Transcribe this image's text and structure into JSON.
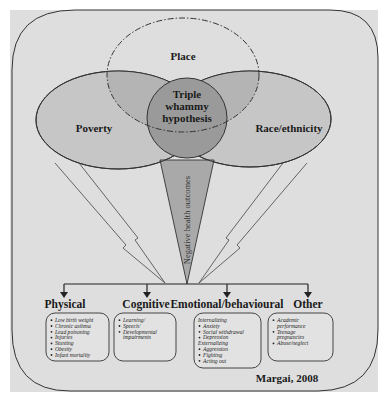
{
  "figure": {
    "colors": {
      "background": "#dedede",
      "frame_stroke": "#333333",
      "ellipse_fill": "#c4c4c4",
      "ellipse_stroke": "#333333",
      "center_fill": "#999999",
      "triangle_fill": "#aaaaaa",
      "arrow_stroke": "#444444"
    },
    "venn": {
      "place_label": "Place",
      "poverty_label": "Poverty",
      "race_label": "Race/ethnicity",
      "center_label": [
        "Triple",
        "whammy",
        "hypothesis"
      ]
    },
    "funnel_label": "Negative health outcomes",
    "categories": [
      {
        "label": "Physical",
        "items": [
          {
            "type": "bullet",
            "text": "Low birth weight"
          },
          {
            "type": "bullet",
            "text": "Chronic asthma"
          },
          {
            "type": "bullet",
            "text": "Lead poisoning"
          },
          {
            "type": "bullet",
            "text": "Injuries"
          },
          {
            "type": "bullet",
            "text": "Stunting"
          },
          {
            "type": "bullet",
            "text": "Obesity"
          },
          {
            "type": "bullet",
            "text": "Infant mortality"
          }
        ]
      },
      {
        "label": "Cognitive",
        "items": [
          {
            "type": "bullet",
            "text": "Learning/"
          },
          {
            "type": "bullet",
            "text": "Speech/"
          },
          {
            "type": "bullet",
            "text": "Developmental"
          },
          {
            "type": "cont",
            "text": "impairments"
          }
        ]
      },
      {
        "label": "Emotional/behavioural",
        "items": [
          {
            "type": "head",
            "text": "Internalizing"
          },
          {
            "type": "bullet",
            "text": "Anxiety"
          },
          {
            "type": "bullet",
            "text": "Social withdrawal"
          },
          {
            "type": "bullet",
            "text": "Depression"
          },
          {
            "type": "head",
            "text": "Externalizing"
          },
          {
            "type": "bullet",
            "text": "Aggression"
          },
          {
            "type": "bullet",
            "text": "Fighting"
          },
          {
            "type": "bullet",
            "text": "Acting out"
          }
        ]
      },
      {
        "label": "Other",
        "items": [
          {
            "type": "bullet",
            "text": "Academic"
          },
          {
            "type": "cont",
            "text": "performance"
          },
          {
            "type": "bullet",
            "text": "Teenage"
          },
          {
            "type": "cont",
            "text": "pregnancies"
          },
          {
            "type": "bullet",
            "text": "Abuse/neglect"
          }
        ]
      }
    ],
    "credit": "Margai, 2008"
  }
}
